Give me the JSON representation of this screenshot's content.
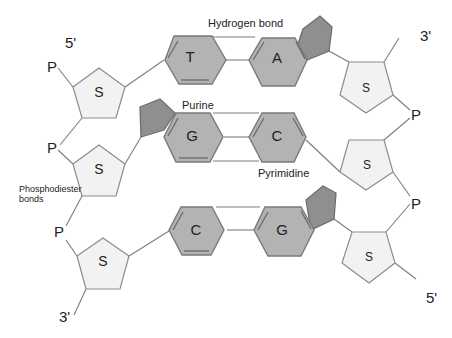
{
  "diagram": {
    "title_labels": {
      "hydrogen_bond": "Hydrogen bond",
      "purine": "Purine",
      "pyrimidine": "Pyrimidine",
      "phosphodiester_line1": "Phosphodiester",
      "phosphodiester_line2": "bonds"
    },
    "ends": {
      "left_top": "5'",
      "left_bottom": "3'",
      "right_top": "3'",
      "right_bottom": "5'"
    },
    "left_strand": {
      "phosphates": [
        "P",
        "P",
        "P"
      ],
      "sugars": [
        "S",
        "S",
        "S"
      ]
    },
    "right_strand": {
      "phosphates": [
        "P",
        "P"
      ],
      "sugars": [
        "S",
        "S",
        "S"
      ]
    },
    "base_pairs": [
      {
        "left": "T",
        "right": "A",
        "left_type": "pyrimidine",
        "right_type": "purine"
      },
      {
        "left": "G",
        "right": "C",
        "left_type": "purine",
        "right_type": "pyrimidine"
      },
      {
        "left": "C",
        "right": "G",
        "left_type": "pyrimidine",
        "right_type": "purine"
      }
    ],
    "colors": {
      "sugar_fill": "#f2f2f2",
      "base_fill": "#b3b3b3",
      "purine_ring_fill": "#8f8f8f",
      "line": "#7d7d7d",
      "text": "#222222"
    }
  }
}
